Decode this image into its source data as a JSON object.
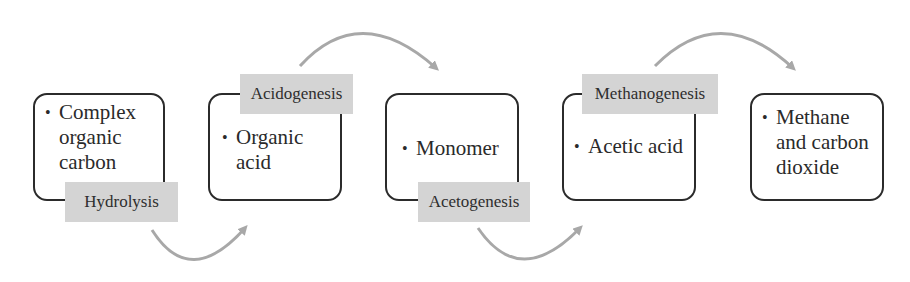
{
  "diagram": {
    "type": "process-flow",
    "title": "",
    "stages": [
      {
        "id": "s1",
        "text": "Complex organic carbon",
        "lines": [
          "Complex",
          "organic",
          "carbon"
        ]
      },
      {
        "id": "s2",
        "text": "Organic acid",
        "lines": [
          "Organic",
          "acid"
        ]
      },
      {
        "id": "s3",
        "text": "Monomer",
        "lines": [
          "Monomer"
        ]
      },
      {
        "id": "s4",
        "text": "Acetic acid",
        "lines": [
          "Acetic acid"
        ]
      },
      {
        "id": "s5",
        "text": "Methane and carbon dioxide",
        "lines": [
          "Methane",
          "and carbon",
          "dioxide"
        ]
      }
    ],
    "processes": [
      {
        "label": "Hydrolysis",
        "from": "s1",
        "to": "s2",
        "position": "bottom"
      },
      {
        "label": "Acidogenesis",
        "from": "s2",
        "to": "s3",
        "position": "top"
      },
      {
        "label": "Acetogenesis",
        "from": "s3",
        "to": "s4",
        "position": "bottom"
      },
      {
        "label": "Methanogenesis",
        "from": "s4",
        "to": "s5",
        "position": "top"
      }
    ],
    "bullet": "•",
    "colors": {
      "box_border": "#2b2b2b",
      "label_bg": "#d4d4d4",
      "arrow": "#a8a8a8"
    }
  }
}
